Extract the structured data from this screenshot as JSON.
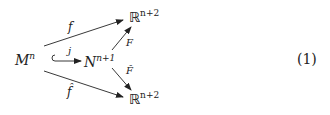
{
  "diagram": {
    "type": "commutative-diagram",
    "nodes": {
      "M": {
        "base": "M",
        "sup": "n"
      },
      "N": {
        "base": "N",
        "sup": "n+1"
      },
      "R_top": {
        "base": "ℝ",
        "sup": "n+2"
      },
      "R_bottom": {
        "base": "ℝ",
        "sup": "n+2"
      }
    },
    "arrows": {
      "f": {
        "label": "f",
        "from": "M",
        "to": "R_top"
      },
      "j": {
        "label": "j",
        "from": "M",
        "to": "N",
        "style": "hook-inclusion"
      },
      "F": {
        "label": "F",
        "from": "N",
        "to": "R_top"
      },
      "F_hat": {
        "label": "F̂",
        "from": "N",
        "to": "R_bottom"
      },
      "f_hat": {
        "label": "f̂",
        "from": "M",
        "to": "R_bottom"
      }
    },
    "equation_number": "(1)"
  }
}
